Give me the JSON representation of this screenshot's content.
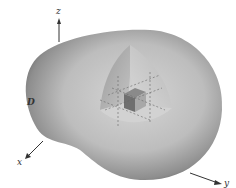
{
  "figure": {
    "labels": {
      "z_axis": "z",
      "x_axis": "x",
      "y_axis": "y",
      "region": "D"
    }
  }
}
